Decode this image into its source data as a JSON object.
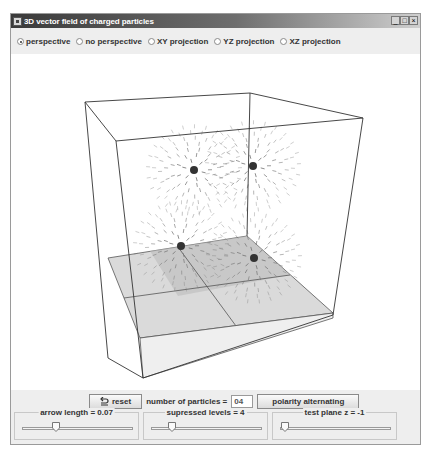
{
  "window": {
    "title": "3D vector field of charged particles",
    "controls": {
      "minimize": "_",
      "maximize": "□",
      "close": "×"
    }
  },
  "view_modes": {
    "selected": "perspective",
    "options": [
      {
        "label": "perspective",
        "checked": true
      },
      {
        "label": "no perspective",
        "checked": false
      },
      {
        "label": "XY projection",
        "checked": false
      },
      {
        "label": "YZ projection",
        "checked": false
      },
      {
        "label": "XZ projection",
        "checked": false
      }
    ]
  },
  "scene": {
    "charges": [
      {
        "x": 194,
        "y": 170
      },
      {
        "x": 253,
        "y": 166
      },
      {
        "x": 181,
        "y": 246
      },
      {
        "x": 254,
        "y": 258
      }
    ],
    "charge_color": "#333333",
    "arrow_color": "#777777",
    "plane_color": "#d6d6d6"
  },
  "controls": {
    "reset_label": "reset",
    "particles_label": "number of particles  =",
    "particles_value": "04",
    "polarity_label": "polarity alternating"
  },
  "sliders": [
    {
      "label": "arrow length = 0.07",
      "position": 0.33
    },
    {
      "label": "supressed levels = 4",
      "position": 0.2
    },
    {
      "label": "test plane z = -1",
      "position": 0.02
    }
  ]
}
